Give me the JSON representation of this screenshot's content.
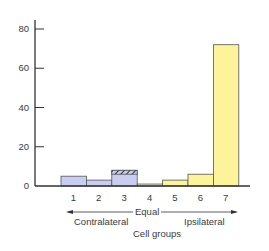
{
  "chart_data": {
    "type": "bar",
    "title": "",
    "xlabel": "Cell groups",
    "ylabel": "",
    "categories": [
      "1",
      "2",
      "3",
      "4",
      "5",
      "6",
      "7"
    ],
    "values": [
      5,
      3,
      8,
      1,
      3,
      6,
      72
    ],
    "hatched_portion": {
      "category": "3",
      "from": 6,
      "to": 8
    },
    "ylim": [
      0,
      85
    ],
    "yticks": [
      0,
      20,
      40,
      60,
      80
    ],
    "grid": false,
    "bar_colors": [
      "#c9cdf0",
      "#c9cdf0",
      "#c9cdf0",
      "#eef3dc",
      "#fdf39a",
      "#fdf39a",
      "#fdf39a"
    ],
    "annotations": {
      "arrow_center_label": "Equal",
      "left_label": "Contralateral",
      "right_label": "Ipsilateral"
    }
  },
  "colors": {
    "contralateral": "#c9cdf0",
    "equal": "#eef3dc",
    "ipsilateral": "#fdf39a",
    "axis": "#333333"
  }
}
